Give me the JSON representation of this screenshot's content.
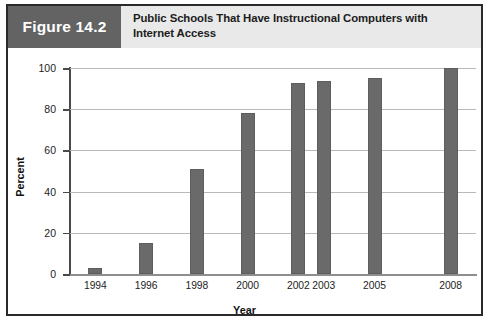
{
  "figure": {
    "tag": "Figure 14.2",
    "title_line1": "Public Schools That Have Instructional Computers with",
    "title_line2": "Internet Access",
    "tag_bg": "#636363",
    "header_bg": "#e9e9e9",
    "border_color": "#2a2a2a"
  },
  "chart_data": {
    "type": "bar",
    "title": "Public Schools That Have Instructional Computers with Internet Access",
    "xlabel": "Year",
    "ylabel": "Percent",
    "categories": [
      "1994",
      "1996",
      "1998",
      "2000",
      "2002",
      "2003",
      "2005",
      "2008"
    ],
    "values": [
      3,
      15,
      51,
      78,
      92.5,
      93.5,
      95,
      100
    ],
    "x_positions": [
      1994,
      1996,
      1998,
      2000,
      2002,
      2003,
      2005,
      2008
    ],
    "ylim": [
      0,
      100
    ],
    "yticks": [
      0,
      20,
      40,
      60,
      80,
      100
    ],
    "ytick_labels": [
      "0",
      "20",
      "40",
      "60",
      "80",
      "100"
    ],
    "grid": "horizontal",
    "legend": "none",
    "bar_color": "#6a6a6a",
    "gridline_color": "#b9b9b9"
  }
}
